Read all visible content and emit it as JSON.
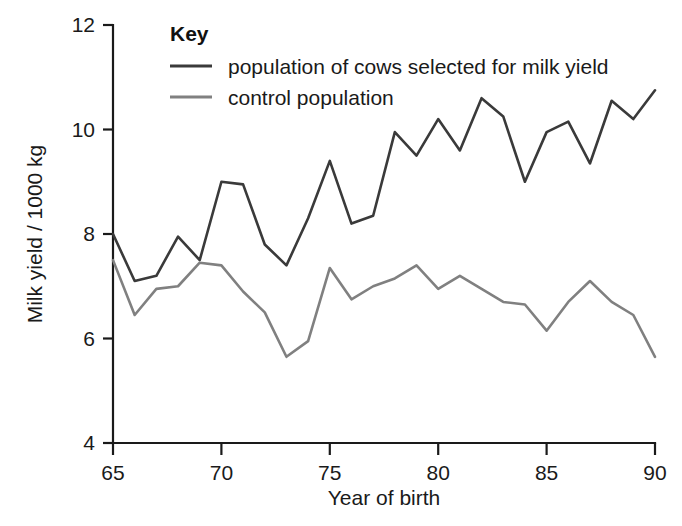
{
  "chart_data": {
    "type": "line",
    "title": "",
    "xlabel": "Year of birth",
    "ylabel": "Milk yield / 1000 kg",
    "xlim": [
      65,
      90
    ],
    "ylim": [
      4,
      12
    ],
    "xticks": [
      65,
      70,
      75,
      80,
      85,
      90
    ],
    "yticks": [
      4,
      6,
      8,
      10,
      12
    ],
    "xtick_labels": [
      "65",
      "70",
      "75",
      "80",
      "85",
      "90"
    ],
    "ytick_labels": [
      "4",
      "6",
      "8",
      "10",
      "12"
    ],
    "grid": false,
    "legend_position": "top-left",
    "legend_title": "Key",
    "x": [
      65,
      66,
      67,
      68,
      69,
      70,
      71,
      72,
      73,
      74,
      75,
      76,
      77,
      78,
      79,
      80,
      81,
      82,
      83,
      84,
      85,
      86,
      87,
      88,
      89,
      90
    ],
    "series": [
      {
        "name": "population of cows selected for milk yield",
        "color": "#3a3a3a",
        "values": [
          8.0,
          7.1,
          7.2,
          7.95,
          7.5,
          9.0,
          8.95,
          7.8,
          7.4,
          8.3,
          9.4,
          8.2,
          8.35,
          9.95,
          9.5,
          10.2,
          9.6,
          10.6,
          10.25,
          9.0,
          9.95,
          10.15,
          9.35,
          10.55,
          10.2,
          10.75
        ]
      },
      {
        "name": "control population",
        "color": "#808080",
        "values": [
          7.5,
          6.45,
          6.95,
          7.0,
          7.45,
          7.4,
          6.9,
          6.5,
          5.65,
          5.95,
          7.35,
          6.75,
          7.0,
          7.15,
          7.4,
          6.95,
          7.2,
          6.95,
          6.7,
          6.65,
          6.15,
          6.7,
          7.1,
          6.7,
          6.45,
          5.65
        ]
      }
    ]
  },
  "legend": {
    "title": "Key",
    "entries": [
      {
        "label": "population of cows selected for milk yield",
        "color": "#3a3a3a"
      },
      {
        "label": "control population",
        "color": "#808080"
      }
    ]
  },
  "axes": {
    "y_title": "Milk yield / 1000 kg",
    "x_title": "Year of birth"
  }
}
